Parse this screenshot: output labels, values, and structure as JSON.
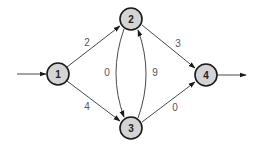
{
  "diagram": {
    "type": "directed weighted graph",
    "nodes": [
      {
        "id": "1",
        "label": "1",
        "x": 58,
        "y": 74
      },
      {
        "id": "2",
        "label": "2",
        "x": 131,
        "y": 19
      },
      {
        "id": "3",
        "label": "3",
        "x": 131,
        "y": 128
      },
      {
        "id": "4",
        "label": "4",
        "x": 206,
        "y": 75
      }
    ],
    "edges": [
      {
        "from": "source",
        "to": "1",
        "weight": ""
      },
      {
        "from": "1",
        "to": "2",
        "weight": "2"
      },
      {
        "from": "1",
        "to": "3",
        "weight": "4"
      },
      {
        "from": "2",
        "to": "3",
        "weight": "0"
      },
      {
        "from": "3",
        "to": "2",
        "weight": "9"
      },
      {
        "from": "2",
        "to": "4",
        "weight": "3"
      },
      {
        "from": "3",
        "to": "4",
        "weight": "0"
      },
      {
        "from": "4",
        "to": "sink",
        "weight": ""
      }
    ],
    "weight_labels": {
      "e12": "2",
      "e13": "4",
      "e23": "0",
      "e32": "9",
      "e24": "3",
      "e34": "0"
    },
    "node_labels": {
      "n1": "1",
      "n2": "2",
      "n3": "3",
      "n4": "4"
    },
    "colors": {
      "node_fill": "#d4d4d4",
      "node_stroke": "#1a1a1a",
      "edge": "#4a4a4a",
      "background": "#ffffff"
    }
  }
}
